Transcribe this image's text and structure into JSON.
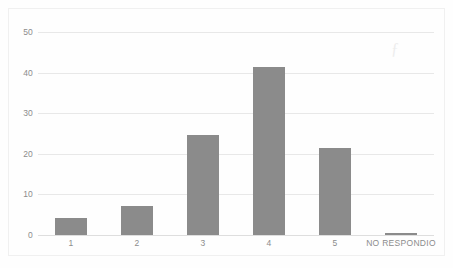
{
  "chart_data": {
    "type": "bar",
    "title": "",
    "subtitle": "",
    "xlabel": "",
    "ylabel": "",
    "categories": [
      "1",
      "2",
      "3",
      "4",
      "5",
      "NO RESPONDIO"
    ],
    "values": [
      4.2,
      7.1,
      24.6,
      41.4,
      21.5,
      0.6
    ],
    "series": [
      {
        "name": "",
        "values": [
          4.2,
          7.1,
          24.6,
          41.4,
          21.5,
          0.6
        ]
      }
    ],
    "ylim": [
      0,
      50
    ],
    "yticks": [
      0,
      10,
      20,
      30,
      40,
      50
    ],
    "ytick_labels": [
      "0",
      "10",
      "20",
      "30",
      "40",
      "50"
    ],
    "grid": "horizontal",
    "legend": "none",
    "bar_color": "#8b8b8b",
    "gridline_color": "#e8e8e8",
    "axis_text_color": "#8c8c8c",
    "background_color": "#fefefe",
    "annotations": []
  }
}
